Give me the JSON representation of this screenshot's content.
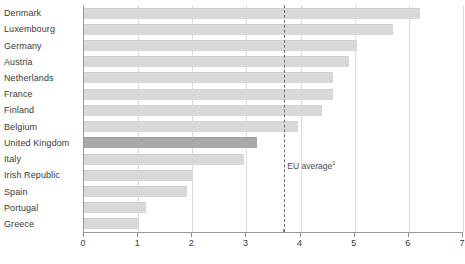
{
  "chart_data": {
    "type": "bar",
    "orientation": "horizontal",
    "title": "",
    "subtitle": "",
    "xlabel": "",
    "ylabel": "",
    "xlim": [
      0,
      7
    ],
    "xticks": [
      0,
      1,
      2,
      3,
      4,
      5,
      6,
      7
    ],
    "xticklabels": [
      "0",
      "1",
      "2",
      "3",
      "4",
      "5",
      "6",
      "7"
    ],
    "grid": true,
    "grid_axis": "x",
    "legend": false,
    "categories": [
      "Denmark",
      "Luxembourg",
      "Germany",
      "Austria",
      "Netherlands",
      "France",
      "Finland",
      "Belgium",
      "United Kingdom",
      "Italy",
      "Irish Republic",
      "Spain",
      "Portugal",
      "Greece"
    ],
    "values": [
      6.2,
      5.7,
      5.05,
      4.9,
      4.6,
      4.6,
      4.4,
      3.95,
      3.2,
      2.95,
      2.0,
      1.9,
      1.15,
      1.0
    ],
    "highlight_category": "United Kingdom",
    "annotations": [
      {
        "name": "eu-average",
        "label": "EU average",
        "superscript": "1",
        "value": 3.7,
        "style": "dashed-vertical-line"
      }
    ],
    "colors": {
      "bar": "#d9d9d9",
      "bar_highlight": "#a9a9a9",
      "gridline": "#dcdcdc",
      "axis": "#9a9a9a",
      "reference_line": "#6e6e6e",
      "text": "#3a3a3a",
      "background": "#ffffff"
    }
  }
}
